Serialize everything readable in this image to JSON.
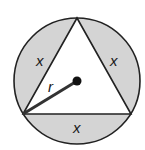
{
  "diagram": {
    "circle": {
      "cx": 77,
      "cy": 81,
      "r": 63,
      "fill": "#d4d4d4",
      "stroke": "#222222"
    },
    "triangle": {
      "points": "77,18 23,114 131,114",
      "fill": "#ffffff",
      "stroke": "#222222"
    },
    "center_dot": {
      "cx": 77,
      "cy": 81,
      "r": 4.5,
      "color": "#111111"
    },
    "radius_line": {
      "x1": 77,
      "y1": 81,
      "x2": 23,
      "y2": 114,
      "color": "#333333"
    },
    "labels": {
      "segment_left": "x",
      "segment_right": "x",
      "segment_bottom": "x",
      "radius": "r"
    }
  }
}
